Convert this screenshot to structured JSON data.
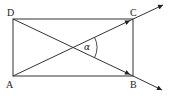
{
  "diagram": {
    "type": "geometry",
    "colors": {
      "stroke": "#333333",
      "background": "#ffffff"
    },
    "points": {
      "A": {
        "label": "A",
        "x": 13,
        "y": 76
      },
      "B": {
        "label": "B",
        "x": 133,
        "y": 76
      },
      "C": {
        "label": "C",
        "x": 133,
        "y": 19
      },
      "D": {
        "label": "D",
        "x": 13,
        "y": 19
      }
    },
    "rays": [
      {
        "name": "ray-AC",
        "from": "A",
        "through": "C"
      },
      {
        "name": "ray-DB",
        "from": "D",
        "through": "B"
      }
    ],
    "angle": {
      "label": "α",
      "between": [
        "AC",
        "DB"
      ]
    }
  }
}
